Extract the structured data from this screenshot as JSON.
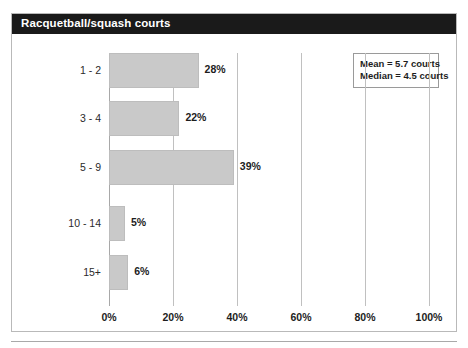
{
  "figure": {
    "title": "Racquetball/squash courts"
  },
  "stats": {
    "mean_label": "Mean = 5.7 courts",
    "median_label": "Median = 4.5 courts"
  },
  "colors": {
    "title_bar": "#1a1a1a",
    "title_text": "#ffffff",
    "bar_fill": "#c9c9c9",
    "gridline": "#c0c0c0",
    "frame": "#b9b9b9"
  },
  "chart_data": {
    "type": "bar",
    "orientation": "horizontal",
    "title": "Racquetball/squash courts",
    "xlabel": "",
    "ylabel": "",
    "categories": [
      "1 - 2",
      "3 - 4",
      "5 - 9",
      "10 - 14",
      "15+"
    ],
    "values": [
      28,
      22,
      39,
      5,
      6
    ],
    "value_labels": [
      "28%",
      "22%",
      "39%",
      "5%",
      "6%"
    ],
    "xlim": [
      0,
      100
    ],
    "xticks": [
      0,
      20,
      40,
      60,
      80,
      100
    ],
    "xtick_labels": [
      "0%",
      "20%",
      "40%",
      "60%",
      "80%",
      "100%"
    ],
    "grid": true,
    "grid_axis": "x",
    "legend": false,
    "annotations": [
      "Mean = 5.7 courts",
      "Median = 4.5 courts"
    ]
  }
}
